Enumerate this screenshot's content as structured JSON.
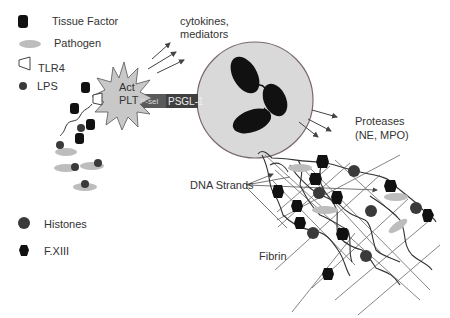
{
  "legend": {
    "items": [
      {
        "key": "tissue_factor",
        "label": "Tissue Factor",
        "icon": "rounded-square-black"
      },
      {
        "key": "pathogen",
        "label": "Pathogen",
        "icon": "gray-ellipse"
      },
      {
        "key": "tlr4",
        "label": "TLR4",
        "icon": "trapezoid-outline"
      },
      {
        "key": "lps",
        "label": "LPS",
        "icon": "small-dark-circle"
      },
      {
        "key": "histones",
        "label": "Histones",
        "icon": "dark-circle"
      },
      {
        "key": "fxiii",
        "label": "F.XIII",
        "icon": "black-hexagon"
      }
    ]
  },
  "platelet": {
    "line1": "Act",
    "line2": "PLT"
  },
  "receptor": {
    "psel": "P-sel",
    "psgl": "PSGL-1"
  },
  "annotations": {
    "cytokines_line1": "cytokines,",
    "cytokines_line2": "mediators",
    "proteases_line1": "Proteases",
    "proteases_line2": "(NE, MPO)",
    "dna_strands": "DNA Strands",
    "fibrin": "Fibrin"
  },
  "colors": {
    "neutrophil_fill": "#d9d9d9",
    "neutrophil_stroke": "#7a6a6a",
    "platelet_fill": "#c8c8c8",
    "bar_dark": "#404040",
    "bar_mid": "#5a5a5a",
    "black": "#111111",
    "histone": "#3a3a3a",
    "pathogen": "#bdbdbd",
    "line": "#555555"
  }
}
